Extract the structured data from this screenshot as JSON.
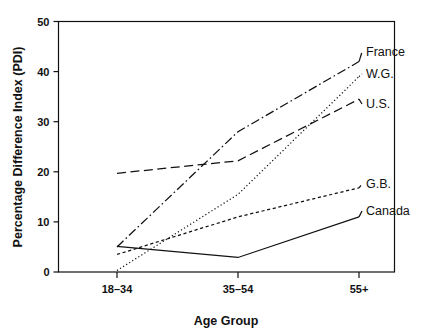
{
  "chart_data": {
    "type": "line",
    "title": "",
    "subtitle": "",
    "xlabel": "Age Group",
    "ylabel": "Percentage Difference Index (PDI)",
    "categories": [
      "18–34",
      "35–54",
      "55+"
    ],
    "xtick_labels": [
      "18–34",
      "35–54",
      "55+"
    ],
    "ytick_labels": [
      "0",
      "10",
      "20",
      "30",
      "40",
      "50"
    ],
    "ytick_values": [
      0,
      10,
      20,
      30,
      40,
      50
    ],
    "ylim": [
      0,
      50
    ],
    "grid": false,
    "legend_position": "right-inline-labels",
    "series": [
      {
        "name": "France",
        "label": "France",
        "values": [
          5.0,
          28.0,
          42.0
        ],
        "dash": "dashdot"
      },
      {
        "name": "W.G.",
        "label": "W.G.",
        "values": [
          0.3,
          15.5,
          39.0
        ],
        "dash": "dotted"
      },
      {
        "name": "U.S.",
        "label": "U.S.",
        "values": [
          19.7,
          22.2,
          34.5
        ],
        "dash": "longdash"
      },
      {
        "name": "G.B.",
        "label": "G.B.",
        "values": [
          3.5,
          11.0,
          16.8
        ],
        "dash": "shortdash"
      },
      {
        "name": "Canada",
        "label": "Canada",
        "values": [
          5.1,
          2.9,
          11.0
        ],
        "dash": "solid"
      }
    ]
  },
  "axes": {
    "x_axis_title": "Age Group",
    "y_axis_title": "Percentage Difference Index (PDI)"
  },
  "colors": {
    "ink": "#111111",
    "background": "#ffffff",
    "frame": "#111111"
  }
}
